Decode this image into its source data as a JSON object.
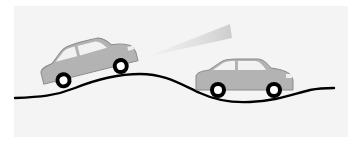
{
  "figure": {
    "title": "Headlight beam on uneven road",
    "elements": {
      "road": "wavy-road-line",
      "car_rear": "car-tilted-uphill",
      "car_front": "car-level",
      "beam": "headlight-beam"
    },
    "colors": {
      "background": "#f4f4f4",
      "car_body": "#b3b3b3",
      "car_outline": "#8a8a8a",
      "window": "#f2f2f2",
      "tire": "#000000",
      "hub": "#ffffff",
      "road": "#000000",
      "beam": "#cfcfcf"
    }
  }
}
